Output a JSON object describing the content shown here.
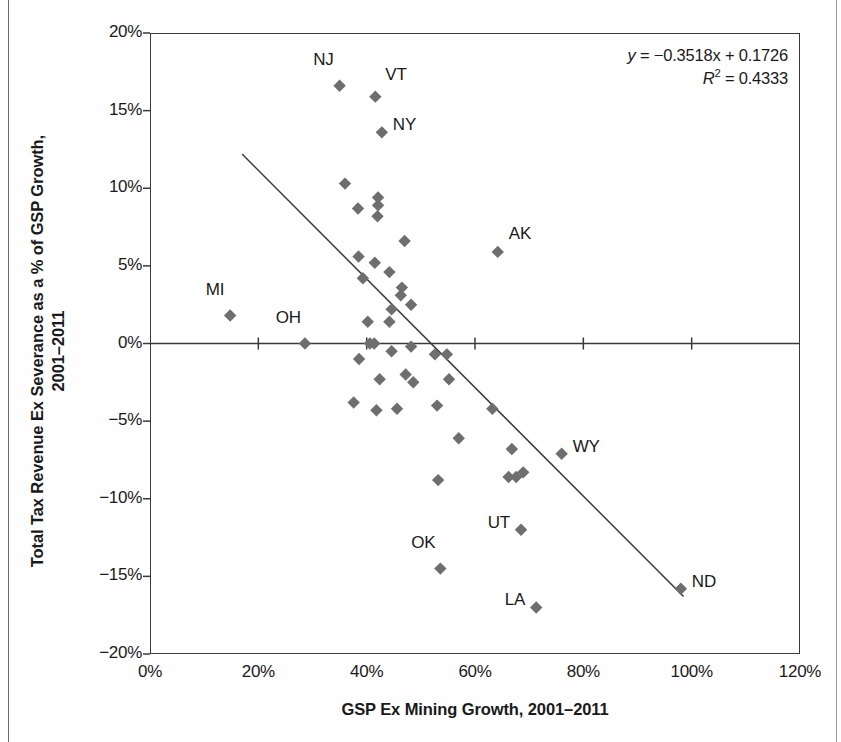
{
  "chart_data": {
    "type": "scatter",
    "title": "",
    "xlabel": "GSP Ex Mining Growth, 2001–2011",
    "ylabel_line1": "Total Tax Revenue Ex Severance as a % of GSP Growth,",
    "ylabel_line2": "2001–2011",
    "xlim": [
      0,
      120
    ],
    "ylim": [
      -20,
      20
    ],
    "xticks": [
      "0%",
      "20%",
      "40%",
      "60%",
      "80%",
      "100%",
      "120%"
    ],
    "xtick_values": [
      0,
      20,
      40,
      60,
      80,
      100,
      120
    ],
    "yticks": [
      "20%",
      "15%",
      "10%",
      "5%",
      "0%",
      "-5%",
      "-10%",
      "-15%",
      "-20%"
    ],
    "ytick_values": [
      20,
      15,
      10,
      5,
      0,
      -5,
      -10,
      -15,
      -20
    ],
    "grid": false,
    "legend": null,
    "marker": "diamond",
    "marker_color": "#6e6e6e",
    "annotation_equation": "y = −0.3518x + 0.1726",
    "annotation_r2": "R² = 0.4333",
    "equation_slope": -0.3518,
    "equation_intercept": 0.1726,
    "r_squared": 0.4333,
    "trendline": {
      "x_start": 17.0,
      "y_start": 12.2,
      "x_end": 98.5,
      "y_end": -16.3
    },
    "points": [
      {
        "label": "MI",
        "x": 14.8,
        "y": 1.8,
        "label_dx": -6,
        "label_dy": -26,
        "label_anchor": "end"
      },
      {
        "label": "OH",
        "x": 28.6,
        "y": 0.0,
        "label_dx": -4,
        "label_dy": -26,
        "label_anchor": "end"
      },
      {
        "label": "NJ",
        "x": 35.0,
        "y": 16.6,
        "label_dx": -6,
        "label_dy": -26,
        "label_anchor": "end"
      },
      {
        "label": "VT",
        "x": 41.6,
        "y": 15.9,
        "label_dx": 10,
        "label_dy": -22,
        "label_anchor": "start"
      },
      {
        "label": "NY",
        "x": 42.8,
        "y": 13.6,
        "label_dx": 11,
        "label_dy": -7,
        "label_anchor": "start"
      },
      {
        "label": "AK",
        "x": 64.2,
        "y": 5.9,
        "label_dx": 11,
        "label_dy": -18,
        "label_anchor": "start"
      },
      {
        "label": "WY",
        "x": 76.0,
        "y": -7.1,
        "label_dx": 11,
        "label_dy": -7,
        "label_anchor": "start"
      },
      {
        "label": "UT",
        "x": 68.5,
        "y": -12.0,
        "label_dx": -11,
        "label_dy": -7,
        "label_anchor": "end"
      },
      {
        "label": "OK",
        "x": 53.6,
        "y": -14.5,
        "label_dx": -5,
        "label_dy": -26,
        "label_anchor": "end"
      },
      {
        "label": "LA",
        "x": 71.3,
        "y": -17.0,
        "label_dx": -11,
        "label_dy": -7,
        "label_anchor": "end"
      },
      {
        "label": "ND",
        "x": 98.0,
        "y": -15.8,
        "label_dx": 11,
        "label_dy": -7,
        "label_anchor": "start"
      },
      {
        "label": "",
        "x": 36.0,
        "y": 10.3
      },
      {
        "label": "",
        "x": 38.4,
        "y": 8.7
      },
      {
        "label": "",
        "x": 42.1,
        "y": 9.4
      },
      {
        "label": "",
        "x": 42.1,
        "y": 8.9
      },
      {
        "label": "",
        "x": 42.0,
        "y": 8.2
      },
      {
        "label": "",
        "x": 47.0,
        "y": 6.6
      },
      {
        "label": "",
        "x": 38.5,
        "y": 5.6
      },
      {
        "label": "",
        "x": 41.5,
        "y": 5.2
      },
      {
        "label": "",
        "x": 44.2,
        "y": 4.6
      },
      {
        "label": "",
        "x": 39.3,
        "y": 4.2
      },
      {
        "label": "",
        "x": 46.5,
        "y": 3.6
      },
      {
        "label": "",
        "x": 46.3,
        "y": 3.1
      },
      {
        "label": "",
        "x": 40.2,
        "y": 1.4
      },
      {
        "label": "",
        "x": 44.2,
        "y": 1.4
      },
      {
        "label": "",
        "x": 44.6,
        "y": 2.2
      },
      {
        "label": "",
        "x": 48.2,
        "y": 2.5
      },
      {
        "label": "",
        "x": 40.6,
        "y": 0.0
      },
      {
        "label": "",
        "x": 41.4,
        "y": 0.0
      },
      {
        "label": "",
        "x": 48.2,
        "y": -0.2
      },
      {
        "label": "",
        "x": 38.6,
        "y": -1.0
      },
      {
        "label": "",
        "x": 44.6,
        "y": -0.5
      },
      {
        "label": "",
        "x": 52.6,
        "y": -0.7
      },
      {
        "label": "",
        "x": 54.8,
        "y": -0.7
      },
      {
        "label": "",
        "x": 42.4,
        "y": -2.3
      },
      {
        "label": "",
        "x": 47.2,
        "y": -2.0
      },
      {
        "label": "",
        "x": 48.6,
        "y": -2.5
      },
      {
        "label": "",
        "x": 55.2,
        "y": -2.3
      },
      {
        "label": "",
        "x": 37.6,
        "y": -3.8
      },
      {
        "label": "",
        "x": 41.8,
        "y": -4.3
      },
      {
        "label": "",
        "x": 45.6,
        "y": -4.2
      },
      {
        "label": "",
        "x": 53.0,
        "y": -4.0
      },
      {
        "label": "",
        "x": 63.2,
        "y": -4.2
      },
      {
        "label": "",
        "x": 57.0,
        "y": -6.1
      },
      {
        "label": "",
        "x": 66.8,
        "y": -6.8
      },
      {
        "label": "",
        "x": 53.2,
        "y": -8.8
      },
      {
        "label": "",
        "x": 66.2,
        "y": -8.6
      },
      {
        "label": "",
        "x": 67.6,
        "y": -8.6
      },
      {
        "label": "",
        "x": 68.9,
        "y": -8.3
      }
    ]
  }
}
